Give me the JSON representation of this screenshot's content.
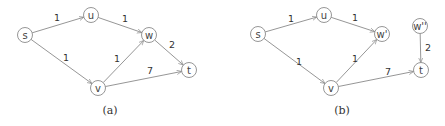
{
  "figures": [
    {
      "id": "a",
      "caption": "(a)",
      "caption_pos": [
        110,
        110
      ],
      "nodes": [
        {
          "id": "s",
          "label": "s",
          "x": 25,
          "y": 35
        },
        {
          "id": "u",
          "label": "u",
          "x": 91,
          "y": 15
        },
        {
          "id": "w",
          "label": "w",
          "x": 149,
          "y": 35
        },
        {
          "id": "v",
          "label": "v",
          "x": 98,
          "y": 88
        },
        {
          "id": "t",
          "label": "t",
          "x": 189,
          "y": 70
        }
      ],
      "edges": [
        {
          "from": "s",
          "to": "u",
          "weight": "1",
          "lx": 57,
          "ly": 17
        },
        {
          "from": "u",
          "to": "w",
          "weight": "1",
          "lx": 125,
          "ly": 18
        },
        {
          "from": "s",
          "to": "v",
          "weight": "1",
          "lx": 66,
          "ly": 57
        },
        {
          "from": "v",
          "to": "w",
          "weight": "1",
          "lx": 117,
          "ly": 58
        },
        {
          "from": "w",
          "to": "t",
          "weight": "2",
          "lx": 172,
          "ly": 44
        },
        {
          "from": "v",
          "to": "t",
          "weight": "7",
          "lx": 150,
          "ly": 70
        }
      ]
    },
    {
      "id": "b",
      "caption": "(b)",
      "caption_pos": [
        342,
        110
      ],
      "nodes": [
        {
          "id": "s",
          "label": "s",
          "x": 258,
          "y": 34
        },
        {
          "id": "u",
          "label": "u",
          "x": 324,
          "y": 15
        },
        {
          "id": "w1",
          "label": "w'",
          "x": 382,
          "y": 34
        },
        {
          "id": "v",
          "label": "v",
          "x": 331,
          "y": 88
        },
        {
          "id": "w2",
          "label": "w''",
          "x": 420,
          "y": 26
        },
        {
          "id": "t",
          "label": "t",
          "x": 421,
          "y": 70
        }
      ],
      "edges": [
        {
          "from": "s",
          "to": "u",
          "weight": "1",
          "lx": 291,
          "ly": 18
        },
        {
          "from": "u",
          "to": "w1",
          "weight": "1",
          "lx": 355,
          "ly": 17
        },
        {
          "from": "s",
          "to": "v",
          "weight": "1",
          "lx": 299,
          "ly": 61
        },
        {
          "from": "v",
          "to": "w1",
          "weight": "1",
          "lx": 355,
          "ly": 58
        },
        {
          "from": "v",
          "to": "t",
          "weight": "7",
          "lx": 388,
          "ly": 71
        },
        {
          "from": "w2",
          "to": "t",
          "weight": "2",
          "lx": 428,
          "ly": 47
        }
      ]
    }
  ]
}
